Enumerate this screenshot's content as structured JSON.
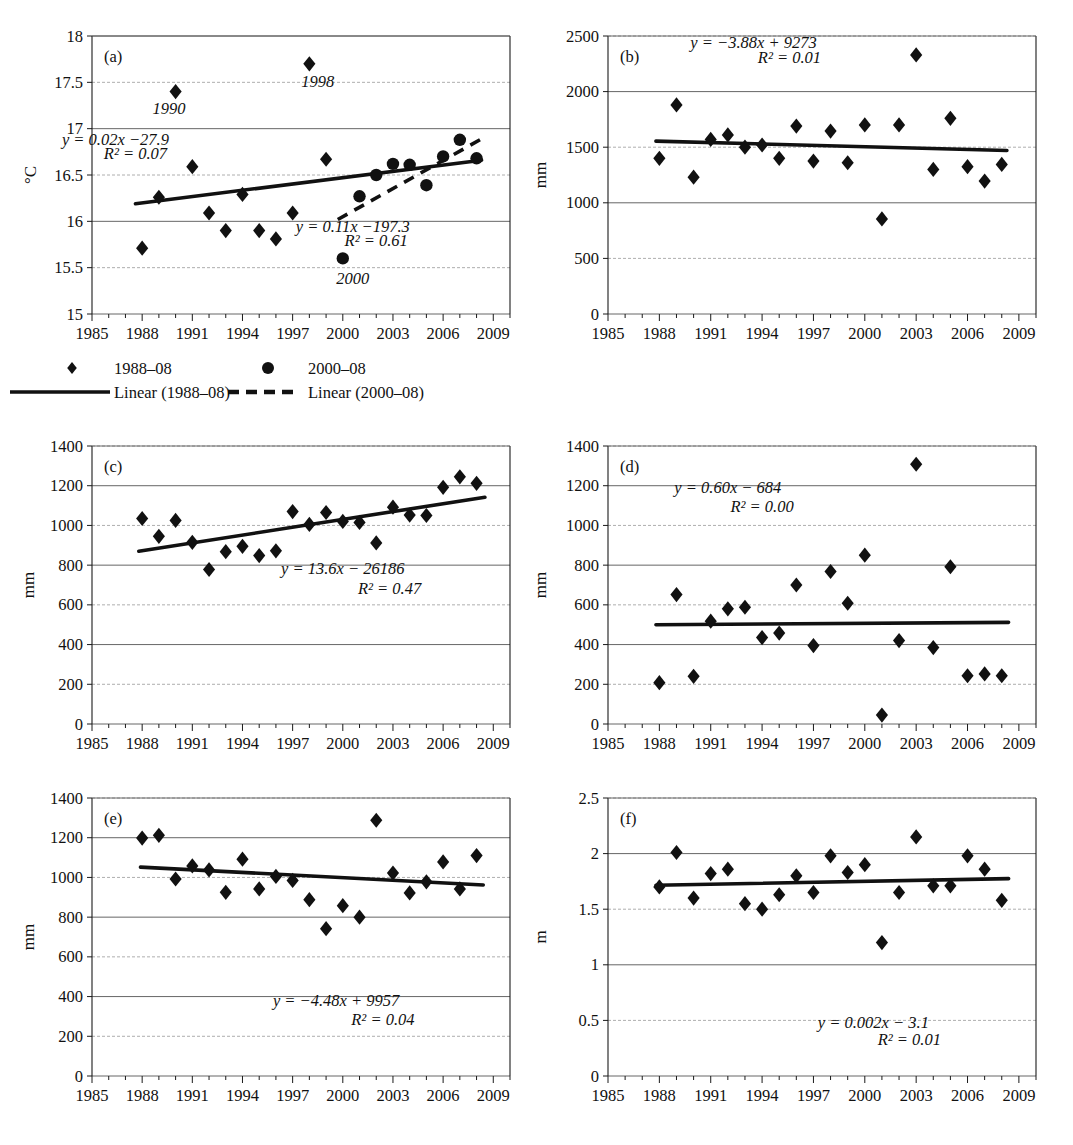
{
  "figure": {
    "xlabel_ticks": [
      "1985",
      "1988",
      "1991",
      "1994",
      "1997",
      "2000",
      "2003",
      "2006",
      "2009"
    ]
  },
  "legend": {
    "items": [
      {
        "label": "1988–08",
        "marker": "diamond-marker"
      },
      {
        "label": "Linear (1988–08)",
        "marker": "solid-line-marker"
      },
      {
        "label": "2000–08",
        "marker": "circle-marker"
      },
      {
        "label": "Linear (2000–08)",
        "marker": "dashed-line-marker"
      }
    ]
  },
  "chart_data": [
    {
      "id": "a",
      "panel_label": "(a)",
      "type": "scatter",
      "title": "",
      "xlabel": "",
      "ylabel": "°C",
      "xlim": [
        1985,
        2010
      ],
      "ylim": [
        15,
        18
      ],
      "yticks": [
        "15",
        "15.5",
        "16",
        "16.5",
        "17",
        "17.5",
        "18"
      ],
      "xticks": [
        "1985",
        "1988",
        "1991",
        "1994",
        "1997",
        "2000",
        "2003",
        "2006",
        "2009"
      ],
      "grid": true,
      "annotations": [
        {
          "text": "y = 0.02x −27.9",
          "x": 1986.4,
          "y": 16.82
        },
        {
          "text": "R² = 0.07",
          "x": 1987.6,
          "y": 16.67
        },
        {
          "text": "y = 0.11x −197.3",
          "x": 2000.6,
          "y": 15.88
        },
        {
          "text": "R² = 0.61",
          "x": 2002.0,
          "y": 15.73
        },
        {
          "text": "1998",
          "x": 1998.5,
          "y": 17.45
        },
        {
          "text": "1990",
          "x": 1989.6,
          "y": 17.16
        },
        {
          "text": "2000",
          "x": 2000.6,
          "y": 15.32
        }
      ],
      "series": [
        {
          "name": "1988–08",
          "marker": "diamond",
          "points": [
            [
              1988,
              15.71
            ],
            [
              1989,
              16.26
            ],
            [
              1990,
              17.4
            ],
            [
              1991,
              16.59
            ],
            [
              1992,
              16.09
            ],
            [
              1993,
              15.9
            ],
            [
              1994,
              16.29
            ],
            [
              1995,
              15.9
            ],
            [
              1996,
              15.81
            ],
            [
              1997,
              16.09
            ],
            [
              1998,
              17.7
            ],
            [
              1999,
              16.67
            ]
          ]
        },
        {
          "name": "2000–08",
          "marker": "circle",
          "points": [
            [
              2000,
              15.6
            ],
            [
              2001,
              16.27
            ],
            [
              2002,
              16.5
            ],
            [
              2003,
              16.62
            ],
            [
              2004,
              16.61
            ],
            [
              2005,
              16.39
            ],
            [
              2006,
              16.7
            ],
            [
              2007,
              16.88
            ],
            [
              2008,
              16.68
            ]
          ]
        }
      ],
      "trendlines": [
        {
          "name": "Linear (1988–08)",
          "style": "solid",
          "x1": 1987.6,
          "y1": 16.19,
          "x2": 2008.3,
          "y2": 16.66
        },
        {
          "name": "Linear (2000–08)",
          "style": "dashed",
          "x1": 1999.7,
          "y1": 16.02,
          "x2": 2008.6,
          "y2": 16.92
        }
      ]
    },
    {
      "id": "b",
      "panel_label": "(b)",
      "type": "scatter",
      "title": "",
      "xlabel": "",
      "ylabel": "mm",
      "xlim": [
        1985,
        2010
      ],
      "ylim": [
        0,
        2500
      ],
      "yticks": [
        "0",
        "500",
        "1000",
        "1500",
        "2000",
        "2500"
      ],
      "xticks": [
        "1985",
        "1988",
        "1991",
        "1994",
        "1997",
        "2000",
        "2003",
        "2006",
        "2009"
      ],
      "grid": true,
      "annotations": [
        {
          "text": "y = −3.88x + 9273",
          "x": 1993.5,
          "y": 2390
        },
        {
          "text": "R² = 0.01",
          "x": 1995.6,
          "y": 2260
        }
      ],
      "series": [
        {
          "name": "1988–08",
          "marker": "diamond",
          "points": [
            [
              1988,
              1400
            ],
            [
              1989,
              1880
            ],
            [
              1990,
              1230
            ],
            [
              1991,
              1570
            ],
            [
              1992,
              1610
            ],
            [
              1993,
              1500
            ],
            [
              1994,
              1520
            ],
            [
              1995,
              1400
            ],
            [
              1996,
              1690
            ],
            [
              1997,
              1375
            ],
            [
              1998,
              1645
            ],
            [
              1999,
              1360
            ],
            [
              2000,
              1700
            ],
            [
              2001,
              855
            ],
            [
              2002,
              1700
            ],
            [
              2003,
              2330
            ],
            [
              2004,
              1300
            ],
            [
              2005,
              1760
            ],
            [
              2006,
              1325
            ],
            [
              2007,
              1195
            ],
            [
              2008,
              1345
            ]
          ]
        }
      ],
      "trendlines": [
        {
          "name": "Linear (1988–08)",
          "style": "solid",
          "x1": 1987.8,
          "y1": 1555,
          "x2": 2008.3,
          "y2": 1470
        }
      ]
    },
    {
      "id": "c",
      "panel_label": "(c)",
      "type": "scatter",
      "title": "",
      "xlabel": "",
      "ylabel": "mm",
      "xlim": [
        1985,
        2010
      ],
      "ylim": [
        0,
        1400
      ],
      "yticks": [
        "0",
        "200",
        "400",
        "600",
        "800",
        "1000",
        "1200",
        "1400"
      ],
      "xticks": [
        "1985",
        "1988",
        "1991",
        "1994",
        "1997",
        "2000",
        "2003",
        "2006",
        "2009"
      ],
      "grid": true,
      "annotations": [
        {
          "text": "y = 13.6x − 26186",
          "x": 2000.0,
          "y": 755
        },
        {
          "text": "R² = 0.47",
          "x": 2002.8,
          "y": 655
        }
      ],
      "series": [
        {
          "name": "1988–08",
          "marker": "diamond",
          "points": [
            [
              1988,
              1035
            ],
            [
              1989,
              945
            ],
            [
              1990,
              1025
            ],
            [
              1991,
              915
            ],
            [
              1992,
              778
            ],
            [
              1993,
              868
            ],
            [
              1994,
              895
            ],
            [
              1995,
              848
            ],
            [
              1996,
              872
            ],
            [
              1997,
              1070
            ],
            [
              1998,
              1005
            ],
            [
              1999,
              1065
            ],
            [
              2000,
              1020
            ],
            [
              2001,
              1015
            ],
            [
              2002,
              912
            ],
            [
              2003,
              1092
            ],
            [
              2004,
              1052
            ],
            [
              2005,
              1050
            ],
            [
              2006,
              1192
            ],
            [
              2007,
              1245
            ],
            [
              2008,
              1212
            ]
          ]
        }
      ],
      "trendlines": [
        {
          "name": "Linear (1988–08)",
          "style": "solid",
          "x1": 1987.8,
          "y1": 870,
          "x2": 2008.5,
          "y2": 1142
        }
      ]
    },
    {
      "id": "d",
      "panel_label": "(d)",
      "type": "scatter",
      "title": "",
      "xlabel": "",
      "ylabel": "mm",
      "xlim": [
        1985,
        2010
      ],
      "ylim": [
        0,
        1400
      ],
      "yticks": [
        "0",
        "200",
        "400",
        "600",
        "800",
        "1000",
        "1200",
        "1400"
      ],
      "xticks": [
        "1985",
        "1988",
        "1991",
        "1994",
        "1997",
        "2000",
        "2003",
        "2006",
        "2009"
      ],
      "grid": true,
      "annotations": [
        {
          "text": "y = 0.60x − 684",
          "x": 1992.0,
          "y": 1163
        },
        {
          "text": "R² = 0.00",
          "x": 1994.0,
          "y": 1068
        }
      ],
      "series": [
        {
          "name": "1988–08",
          "marker": "diamond",
          "points": [
            [
              1988,
              208
            ],
            [
              1989,
              652
            ],
            [
              1990,
              240
            ],
            [
              1991,
              518
            ],
            [
              1992,
              580
            ],
            [
              1993,
              588
            ],
            [
              1994,
              435
            ],
            [
              1995,
              458
            ],
            [
              1996,
              700
            ],
            [
              1997,
              395
            ],
            [
              1998,
              768
            ],
            [
              1999,
              608
            ],
            [
              2000,
              850
            ],
            [
              2001,
              45
            ],
            [
              2002,
              420
            ],
            [
              2003,
              1308
            ],
            [
              2004,
              385
            ],
            [
              2005,
              792
            ],
            [
              2006,
              243
            ],
            [
              2007,
              252
            ],
            [
              2008,
              243
            ]
          ]
        }
      ],
      "trendlines": [
        {
          "name": "Linear (1988–08)",
          "style": "solid",
          "x1": 1987.8,
          "y1": 500,
          "x2": 2008.4,
          "y2": 512
        }
      ]
    },
    {
      "id": "e",
      "panel_label": "(e)",
      "type": "scatter",
      "title": "",
      "xlabel": "",
      "ylabel": "mm",
      "xlim": [
        1985,
        2010
      ],
      "ylim": [
        0,
        1400
      ],
      "yticks": [
        "0",
        "200",
        "400",
        "600",
        "800",
        "1000",
        "1200",
        "1400"
      ],
      "xticks": [
        "1985",
        "1988",
        "1991",
        "1994",
        "1997",
        "2000",
        "2003",
        "2006",
        "2009"
      ],
      "grid": true,
      "annotations": [
        {
          "text": "y = −4.48x + 9957",
          "x": 1999.6,
          "y": 352
        },
        {
          "text": "R² = 0.04",
          "x": 2002.4,
          "y": 255
        }
      ],
      "series": [
        {
          "name": "1988–08",
          "marker": "diamond",
          "points": [
            [
              1988,
              1198
            ],
            [
              1989,
              1212
            ],
            [
              1990,
              992
            ],
            [
              1991,
              1058
            ],
            [
              1992,
              1038
            ],
            [
              1993,
              925
            ],
            [
              1994,
              1092
            ],
            [
              1995,
              942
            ],
            [
              1996,
              1005
            ],
            [
              1997,
              985
            ],
            [
              1998,
              888
            ],
            [
              1999,
              742
            ],
            [
              2000,
              858
            ],
            [
              2001,
              800
            ],
            [
              2002,
              1288
            ],
            [
              2003,
              1022
            ],
            [
              2004,
              922
            ],
            [
              2005,
              978
            ],
            [
              2006,
              1078
            ],
            [
              2007,
              942
            ],
            [
              2008,
              1110
            ]
          ]
        }
      ],
      "trendlines": [
        {
          "name": "Linear (1988–08)",
          "style": "solid",
          "x1": 1987.9,
          "y1": 1052,
          "x2": 2008.4,
          "y2": 962
        }
      ]
    },
    {
      "id": "f",
      "panel_label": "(f)",
      "type": "scatter",
      "title": "",
      "xlabel": "",
      "ylabel": "m",
      "xlim": [
        1985,
        2010
      ],
      "ylim": [
        0,
        2.5
      ],
      "yticks": [
        "0",
        "0.5",
        "1",
        "1.5",
        "2",
        "2.5"
      ],
      "xticks": [
        "1985",
        "1988",
        "1991",
        "1994",
        "1997",
        "2000",
        "2003",
        "2006",
        "2009"
      ],
      "grid": true,
      "annotations": [
        {
          "text": "y = 0.002x − 3.1",
          "x": 2000.5,
          "y": 0.43
        },
        {
          "text": "R² = 0.01",
          "x": 2002.6,
          "y": 0.28
        }
      ],
      "series": [
        {
          "name": "1988–08",
          "marker": "diamond",
          "points": [
            [
              1988,
              1.7
            ],
            [
              1989,
              2.01
            ],
            [
              1990,
              1.6
            ],
            [
              1991,
              1.82
            ],
            [
              1992,
              1.86
            ],
            [
              1993,
              1.55
            ],
            [
              1994,
              1.5
            ],
            [
              1995,
              1.63
            ],
            [
              1996,
              1.8
            ],
            [
              1997,
              1.65
            ],
            [
              1998,
              1.98
            ],
            [
              1999,
              1.83
            ],
            [
              2000,
              1.9
            ],
            [
              2001,
              1.2
            ],
            [
              2002,
              1.65
            ],
            [
              2003,
              2.15
            ],
            [
              2004,
              1.71
            ],
            [
              2005,
              1.71
            ],
            [
              2006,
              1.98
            ],
            [
              2007,
              1.86
            ],
            [
              2008,
              1.58
            ]
          ]
        }
      ],
      "trendlines": [
        {
          "name": "Linear (1988–08)",
          "style": "solid",
          "x1": 1987.8,
          "y1": 1.715,
          "x2": 2008.4,
          "y2": 1.775
        }
      ]
    }
  ]
}
